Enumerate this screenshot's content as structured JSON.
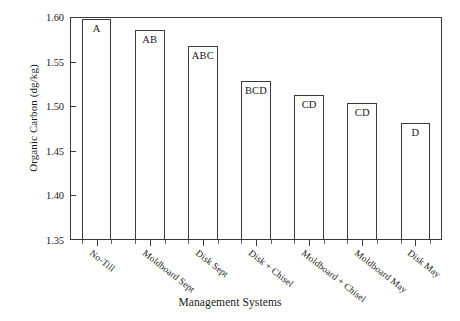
{
  "chart_data": {
    "type": "bar",
    "title": "",
    "xlabel": "Management Systems",
    "ylabel": "Organic Carbon (dg/kg)",
    "ylim": [
      1.35,
      1.6
    ],
    "yticks": [
      "1.35",
      "1.40",
      "1.45",
      "1.50",
      "1.55",
      "1.60"
    ],
    "ytick_values": [
      1.35,
      1.4,
      1.45,
      1.5,
      1.55,
      1.6
    ],
    "grid": false,
    "legend": "none",
    "categories": [
      "No-Till",
      "Moldboard Sept",
      "Disk Sept",
      "Disk + Chisel",
      "Moldboard + Chisel",
      "Moldboard May",
      "Disk May"
    ],
    "values": [
      1.598,
      1.585,
      1.567,
      1.528,
      1.513,
      1.504,
      1.481
    ],
    "annotations": [
      "A",
      "AB",
      "ABC",
      "BCD",
      "CD",
      "CD",
      "D"
    ],
    "bars": [
      {
        "category": "No-Till",
        "value": 1.598,
        "letter": "A"
      },
      {
        "category": "Moldboard Sept",
        "value": 1.585,
        "letter": "AB"
      },
      {
        "category": "Disk Sept",
        "value": 1.567,
        "letter": "ABC"
      },
      {
        "category": "Disk + Chisel",
        "value": 1.528,
        "letter": "BCD"
      },
      {
        "category": "Moldboard + Chisel",
        "value": 1.513,
        "letter": "CD"
      },
      {
        "category": "Moldboard May",
        "value": 1.504,
        "letter": "CD"
      },
      {
        "category": "Disk May",
        "value": 1.481,
        "letter": "D"
      }
    ]
  },
  "colors": {
    "axis": "#3a3a3a",
    "bar_outline": "#3a3a3a",
    "background": "#ffffff",
    "text": "#1a1a1a"
  }
}
